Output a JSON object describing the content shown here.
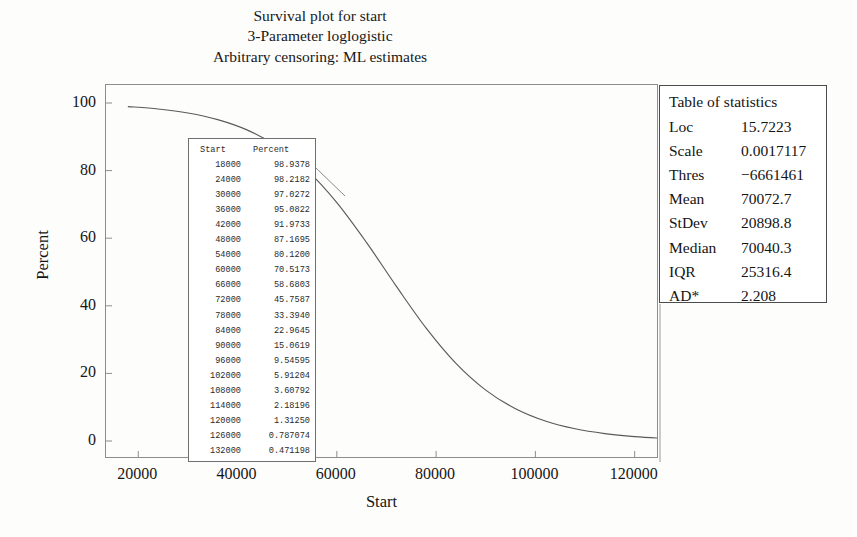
{
  "chart_data": {
    "type": "line",
    "title": "Survival plot for start",
    "subtitle": "3-Parameter loglogistic",
    "subtitle2": "Arbitrary censoring: ML estimates",
    "xlabel": "Start",
    "ylabel": "Percent",
    "xlim": [
      13500,
      124500
    ],
    "ylim": [
      0,
      100
    ],
    "grid": false,
    "legend": "none",
    "xticks": [
      20000,
      40000,
      60000,
      80000,
      100000,
      120000
    ],
    "xtick_labels": [
      "20000",
      "40000",
      "60000",
      "80000",
      "100000",
      "120000"
    ],
    "yticks": [
      0,
      20,
      40,
      60,
      80,
      100
    ],
    "ytick_labels": [
      "0",
      "20",
      "40",
      "60",
      "80",
      "100"
    ],
    "x": [
      18000,
      24000,
      30000,
      36000,
      42000,
      48000,
      54000,
      60000,
      66000,
      72000,
      78000,
      84000,
      90000,
      96000,
      102000,
      108000,
      114000,
      120000,
      126000,
      132000
    ],
    "values": [
      98.9378,
      98.2182,
      97.0272,
      95.0822,
      91.9733,
      87.1695,
      80.12,
      70.5173,
      58.6803,
      45.7587,
      33.394,
      22.9645,
      15.0619,
      9.54595,
      5.91204,
      3.60792,
      2.18196,
      1.3125,
      0.787074,
      0.471198
    ],
    "series_color": "#5a5a5a"
  },
  "titles": {
    "line1": "Survival plot for start",
    "line2": "3-Parameter loglogistic",
    "line3": "Arbitrary censoring: ML estimates"
  },
  "axes": {
    "x_title": "Start",
    "y_title": "Percent",
    "x_ticks": [
      "20000",
      "40000",
      "60000",
      "80000",
      "100000",
      "120000"
    ],
    "y_ticks": [
      "100",
      "80",
      "60",
      "40",
      "20",
      "0"
    ]
  },
  "data_table": {
    "headers": [
      "Start",
      "Percent"
    ],
    "rows": [
      [
        "18000",
        "98.9378"
      ],
      [
        "24000",
        "98.2182"
      ],
      [
        "30000",
        "97.0272"
      ],
      [
        "36000",
        "95.0822"
      ],
      [
        "42000",
        "91.9733"
      ],
      [
        "48000",
        "87.1695"
      ],
      [
        "54000",
        "80.1200"
      ],
      [
        "60000",
        "70.5173"
      ],
      [
        "66000",
        "58.6803"
      ],
      [
        "72000",
        "45.7587"
      ],
      [
        "78000",
        "33.3940"
      ],
      [
        "84000",
        "22.9645"
      ],
      [
        "90000",
        "15.0619"
      ],
      [
        "96000",
        "9.54595"
      ],
      [
        "102000",
        "5.91204"
      ],
      [
        "108000",
        "3.60792"
      ],
      [
        "114000",
        "2.18196"
      ],
      [
        "120000",
        "1.31250"
      ],
      [
        "126000",
        "0.787074"
      ],
      [
        "132000",
        "0.471198"
      ]
    ]
  },
  "stats_table": {
    "header": "Table of statistics",
    "rows": [
      [
        "Loc",
        "15.7223"
      ],
      [
        "Scale",
        "0.0017117"
      ],
      [
        "Thres",
        "−6661461"
      ],
      [
        "Mean",
        "70072.7"
      ],
      [
        "StDev",
        "20898.8"
      ],
      [
        "Median",
        "70040.3"
      ],
      [
        "IQR",
        "25316.4"
      ],
      [
        "AD*",
        "2.208"
      ]
    ]
  }
}
